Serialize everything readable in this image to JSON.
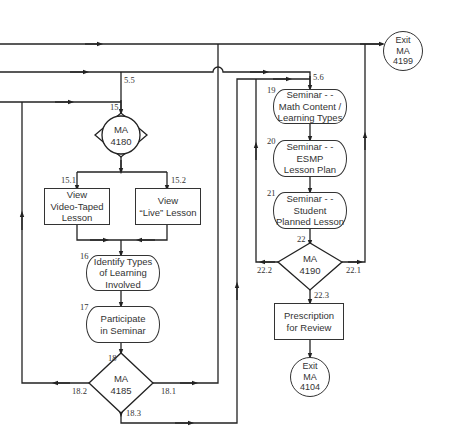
{
  "diagram": {
    "type": "flowchart",
    "nodes": {
      "exit_4199": {
        "label_lines": [
          "Exit",
          "MA",
          "4199"
        ],
        "shape": "circle"
      },
      "d15": {
        "number": "15",
        "label_lines": [
          "MA",
          "4180"
        ],
        "shape": "decision-circle"
      },
      "n15_1": {
        "number": "15.1",
        "label_lines": [
          "View",
          "Video-Taped",
          "Lesson"
        ],
        "shape": "rect"
      },
      "n15_2": {
        "number": "15.2",
        "label_lines": [
          "View",
          "“Live” Lesson"
        ],
        "shape": "rect"
      },
      "n16": {
        "number": "16",
        "label_lines": [
          "Identify Types",
          "of Learning",
          "Involved"
        ],
        "shape": "terminal"
      },
      "n17": {
        "number": "17",
        "label_lines": [
          "Participate",
          "in Seminar"
        ],
        "shape": "terminal"
      },
      "d18": {
        "number": "18",
        "label_lines": [
          "MA",
          "4185"
        ],
        "shape": "diamond"
      },
      "n19": {
        "number": "19",
        "label_lines": [
          "Seminar - -",
          "Math Content /",
          "Learning Types"
        ],
        "shape": "terminal"
      },
      "n20": {
        "number": "20",
        "label_lines": [
          "Seminar - -",
          "ESMP",
          "Lesson Plan"
        ],
        "shape": "terminal"
      },
      "n21": {
        "number": "21",
        "label_lines": [
          "Seminar - -",
          "Student",
          "Planned Lesson"
        ],
        "shape": "terminal"
      },
      "d22": {
        "number": "22",
        "label_lines": [
          "MA",
          "4190"
        ],
        "shape": "diamond"
      },
      "prescription": {
        "label_lines": [
          "Prescription",
          "for Review"
        ],
        "shape": "rect"
      },
      "exit_4104": {
        "label_lines": [
          "Exit",
          "MA",
          "4104"
        ],
        "shape": "circle"
      }
    },
    "edge_labels": {
      "e5_5": "5.5",
      "e5_6": "5.6",
      "e18_1": "18.1",
      "e18_2": "18.2",
      "e18_3": "18.3",
      "e22_1": "22.1",
      "e22_2": "22.2",
      "e22_3": "22.3"
    },
    "edges": [
      {
        "from": "left-entry-top",
        "to": "exit_4199"
      },
      {
        "from": "left-entry-middle",
        "to": "d15",
        "label": "5.5"
      },
      {
        "from": "left-entry-middle",
        "to": "n19",
        "label": "5.6"
      },
      {
        "from": "left-entry-bottom",
        "to": "d15"
      },
      {
        "from": "d15",
        "to": "n15_1",
        "label": "15.1"
      },
      {
        "from": "d15",
        "to": "n15_2",
        "label": "15.2"
      },
      {
        "from": "n15_1",
        "to": "n16"
      },
      {
        "from": "n15_2",
        "to": "n16"
      },
      {
        "from": "n16",
        "to": "n17"
      },
      {
        "from": "n17",
        "to": "d18"
      },
      {
        "from": "d18",
        "to": "exit_4199",
        "label": "18.1"
      },
      {
        "from": "d18",
        "to": "d15",
        "label": "18.2"
      },
      {
        "from": "d18",
        "to": "n19",
        "label": "18.3"
      },
      {
        "from": "n19",
        "to": "n20"
      },
      {
        "from": "n20",
        "to": "n21"
      },
      {
        "from": "n21",
        "to": "d22"
      },
      {
        "from": "d22",
        "to": "exit_4199",
        "label": "22.1"
      },
      {
        "from": "d22",
        "to": "n19",
        "label": "22.2"
      },
      {
        "from": "d22",
        "to": "prescription",
        "label": "22.3"
      },
      {
        "from": "prescription",
        "to": "exit_4104"
      }
    ]
  }
}
